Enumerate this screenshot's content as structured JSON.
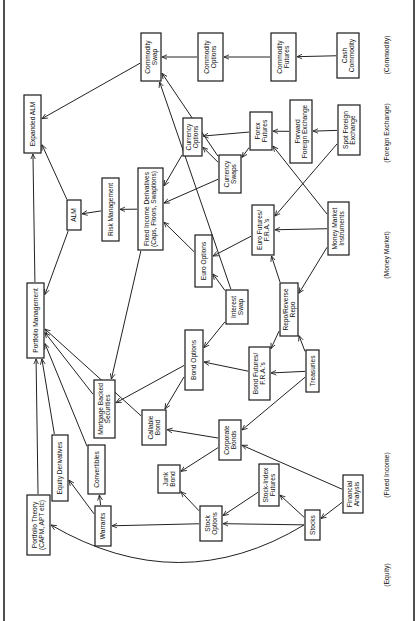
{
  "diagram": {
    "orientation": "rotated-90-ccw",
    "categories": [
      {
        "id": "equity",
        "label": "(Equity)",
        "y": 575
      },
      {
        "id": "fixed_income",
        "label": "(Fixed Income)",
        "y": 475
      },
      {
        "id": "money_market",
        "label": "(Money Market)",
        "y": 255
      },
      {
        "id": "foreign_exchange",
        "label": "(Foreign Exchange)",
        "y": 133
      },
      {
        "id": "commodity",
        "label": "(Commodity)",
        "y": 55
      }
    ],
    "nodes": [
      {
        "id": "expanded_alm",
        "lines": [
          "Expanded ALM"
        ],
        "x": 24,
        "y": 95,
        "w": 17,
        "h": 58
      },
      {
        "id": "portfolio_management",
        "lines": [
          "Portfolio Management"
        ],
        "x": 27,
        "y": 283,
        "w": 17,
        "h": 75
      },
      {
        "id": "portfolio_theory",
        "lines": [
          "Portfolio Theory",
          "(CAPM, APT etc)"
        ],
        "x": 27,
        "y": 495,
        "w": 23,
        "h": 60
      },
      {
        "id": "alm",
        "lines": [
          "ALM"
        ],
        "x": 67,
        "y": 200,
        "w": 14,
        "h": 30
      },
      {
        "id": "risk_management",
        "lines": [
          "Risk Management"
        ],
        "x": 102,
        "y": 178,
        "w": 17,
        "h": 63
      },
      {
        "id": "mortgage_backed",
        "lines": [
          "Mortgage Backed",
          "Securities"
        ],
        "x": 94,
        "y": 380,
        "w": 21,
        "h": 58
      },
      {
        "id": "equity_derivatives",
        "lines": [
          "Equity Derivatives"
        ],
        "x": 52,
        "y": 435,
        "w": 16,
        "h": 66
      },
      {
        "id": "convertibles",
        "lines": [
          "Convertibles"
        ],
        "x": 88,
        "y": 445,
        "w": 17,
        "h": 49
      },
      {
        "id": "warrants",
        "lines": [
          "Warrants"
        ],
        "x": 95,
        "y": 506,
        "w": 16,
        "h": 40
      },
      {
        "id": "fixed_income_derivatives",
        "lines": [
          "Fixed Income Derivatives",
          "(Caps, Floors, Swaptions)"
        ],
        "x": 138,
        "y": 168,
        "w": 25,
        "h": 82
      },
      {
        "id": "euro_options",
        "lines": [
          "Euro Options"
        ],
        "x": 195,
        "y": 235,
        "w": 17,
        "h": 52
      },
      {
        "id": "currency_options",
        "lines": [
          "Currency",
          "Options"
        ],
        "x": 183,
        "y": 118,
        "w": 19,
        "h": 38
      },
      {
        "id": "currency_swaps",
        "lines": [
          "Currency",
          "Swaps"
        ],
        "x": 219,
        "y": 155,
        "w": 22,
        "h": 38
      },
      {
        "id": "commodity_swap",
        "lines": [
          "Commodity",
          "Swap"
        ],
        "x": 141,
        "y": 33,
        "w": 20,
        "h": 48
      },
      {
        "id": "commodity_options",
        "lines": [
          "Commodity",
          "Options"
        ],
        "x": 198,
        "y": 33,
        "w": 25,
        "h": 48
      },
      {
        "id": "commodity_futures",
        "lines": [
          "Commodity",
          "Futures"
        ],
        "x": 271,
        "y": 33,
        "w": 25,
        "h": 48
      },
      {
        "id": "cash_commodity",
        "lines": [
          "Cash",
          "Commodity"
        ],
        "x": 337,
        "y": 33,
        "w": 22,
        "h": 45
      },
      {
        "id": "forex_futures",
        "lines": [
          "Forex",
          "Futures"
        ],
        "x": 250,
        "y": 112,
        "w": 22,
        "h": 38
      },
      {
        "id": "forward_fx",
        "lines": [
          "Forward",
          "Foreign Exchange"
        ],
        "x": 290,
        "y": 100,
        "w": 22,
        "h": 63
      },
      {
        "id": "spot_fx",
        "lines": [
          "Spot Foreign",
          "Exchange"
        ],
        "x": 338,
        "y": 105,
        "w": 22,
        "h": 50
      },
      {
        "id": "euro_futures",
        "lines": [
          "Euro Futures/",
          "F.R.A.'s"
        ],
        "x": 252,
        "y": 205,
        "w": 22,
        "h": 50
      },
      {
        "id": "money_market_instruments",
        "lines": [
          "Money Market",
          "Instruments"
        ],
        "x": 328,
        "y": 202,
        "w": 21,
        "h": 53
      },
      {
        "id": "interest_swap",
        "lines": [
          "Interest",
          "Swap"
        ],
        "x": 226,
        "y": 290,
        "w": 22,
        "h": 34
      },
      {
        "id": "repo",
        "lines": [
          "Repo/Reverse",
          "Repo"
        ],
        "x": 280,
        "y": 283,
        "w": 18,
        "h": 53
      },
      {
        "id": "bond_options",
        "lines": [
          "Bond Options"
        ],
        "x": 185,
        "y": 330,
        "w": 18,
        "h": 60
      },
      {
        "id": "bond_futures",
        "lines": [
          "Bond Futures/",
          "F.R.A.'s"
        ],
        "x": 249,
        "y": 347,
        "w": 21,
        "h": 53
      },
      {
        "id": "treasuries",
        "lines": [
          "Treasuries"
        ],
        "x": 306,
        "y": 350,
        "w": 13,
        "h": 42
      },
      {
        "id": "callable_bond",
        "lines": [
          "Callable",
          "Bond"
        ],
        "x": 142,
        "y": 410,
        "w": 24,
        "h": 35
      },
      {
        "id": "corporate_bonds",
        "lines": [
          "Corporate",
          "Bonds"
        ],
        "x": 219,
        "y": 420,
        "w": 22,
        "h": 40
      },
      {
        "id": "junk_bond",
        "lines": [
          "Junk",
          "Bond"
        ],
        "x": 158,
        "y": 465,
        "w": 22,
        "h": 28
      },
      {
        "id": "stock_index_futures",
        "lines": [
          "Stock-Index",
          "Futures"
        ],
        "x": 259,
        "y": 464,
        "w": 20,
        "h": 42
      },
      {
        "id": "stock_options",
        "lines": [
          "Stock",
          "Options"
        ],
        "x": 200,
        "y": 506,
        "w": 22,
        "h": 35
      },
      {
        "id": "stocks",
        "lines": [
          "Stocks"
        ],
        "x": 305,
        "y": 510,
        "w": 15,
        "h": 30
      },
      {
        "id": "financial_analysis",
        "lines": [
          "Financial",
          "Analysis"
        ],
        "x": 343,
        "y": 475,
        "w": 20,
        "h": 38
      }
    ],
    "edges": [
      [
        "portfolio_management",
        "expanded_alm"
      ],
      [
        "alm",
        "expanded_alm"
      ],
      [
        "commodity_swap",
        "expanded_alm"
      ],
      [
        "alm",
        "portfolio_management"
      ],
      [
        "risk_management",
        "alm"
      ],
      [
        "fixed_income_derivatives",
        "risk_management"
      ],
      [
        "fixed_income_derivatives",
        "mortgage_backed"
      ],
      [
        "mortgage_backed",
        "portfolio_management"
      ],
      [
        "bond_options",
        "mortgage_backed"
      ],
      [
        "portfolio_theory",
        "portfolio_management"
      ],
      [
        "equity_derivatives",
        "portfolio_management"
      ],
      [
        "convertibles",
        "portfolio_management"
      ],
      [
        "callable_bond",
        "portfolio_management"
      ],
      [
        "warrants",
        "equity_derivatives"
      ],
      [
        "warrants",
        "convertibles"
      ],
      [
        "stocks",
        "portfolio_theory"
      ],
      [
        "stock_options",
        "warrants"
      ],
      [
        "stock_options",
        "junk_bond"
      ],
      [
        "stock_index_futures",
        "stock_options"
      ],
      [
        "stocks",
        "stock_options"
      ],
      [
        "stocks",
        "stock_index_futures"
      ],
      [
        "financial_analysis",
        "stocks"
      ],
      [
        "financial_analysis",
        "corporate_bonds"
      ],
      [
        "corporate_bonds",
        "callable_bond"
      ],
      [
        "corporate_bonds",
        "junk_bond"
      ],
      [
        "bond_options",
        "callable_bond"
      ],
      [
        "bond_futures",
        "bond_options"
      ],
      [
        "interest_swap",
        "bond_options"
      ],
      [
        "treasuries",
        "bond_futures"
      ],
      [
        "treasuries",
        "corporate_bonds"
      ],
      [
        "treasuries",
        "repo"
      ],
      [
        "repo",
        "bond_futures"
      ],
      [
        "repo",
        "euro_futures"
      ],
      [
        "money_market_instruments",
        "repo"
      ],
      [
        "money_market_instruments",
        "euro_futures"
      ],
      [
        "money_market_instruments",
        "forex_futures"
      ],
      [
        "spot_fx",
        "forward_fx"
      ],
      [
        "spot_fx",
        "euro_futures"
      ],
      [
        "forward_fx",
        "forex_futures"
      ],
      [
        "forex_futures",
        "currency_options"
      ],
      [
        "forex_futures",
        "currency_swaps"
      ],
      [
        "currency_swaps",
        "currency_options"
      ],
      [
        "currency_swaps",
        "fixed_income_derivatives"
      ],
      [
        "currency_swaps",
        "commodity_swap"
      ],
      [
        "currency_options",
        "fixed_income_derivatives"
      ],
      [
        "euro_options",
        "fixed_income_derivatives"
      ],
      [
        "euro_futures",
        "euro_options"
      ],
      [
        "interest_swap",
        "euro_options"
      ],
      [
        "interest_swap",
        "commodity_swap"
      ],
      [
        "cash_commodity",
        "commodity_futures"
      ],
      [
        "commodity_futures",
        "commodity_options"
      ],
      [
        "commodity_options",
        "commodity_swap"
      ]
    ]
  }
}
